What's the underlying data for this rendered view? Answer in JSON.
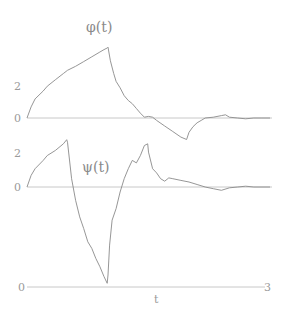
{
  "chart_data": [
    {
      "type": "line",
      "title": "φ(t)",
      "xlabel": "t",
      "ylabel": "",
      "xlim": [
        0,
        3
      ],
      "ylim": [
        -1,
        4.5
      ],
      "yticks": [
        "0",
        "2"
      ],
      "grid": false,
      "series": [
        {
          "name": "phi",
          "x": [
            0,
            0.05,
            0.1,
            0.2,
            0.25,
            0.35,
            0.45,
            0.5,
            0.6,
            0.7,
            0.8,
            0.9,
            0.95,
            0.99,
            1.0,
            1.03,
            1.07,
            1.1,
            1.15,
            1.2,
            1.25,
            1.3,
            1.35,
            1.4,
            1.45,
            1.5,
            1.55,
            1.6,
            1.7,
            1.8,
            1.9,
            1.97,
            2.0,
            2.05,
            2.1,
            2.15,
            2.2,
            2.3,
            2.4,
            2.45,
            2.5,
            2.6,
            2.7,
            2.8,
            2.9,
            3.0
          ],
          "values": [
            0,
            0.7,
            1.2,
            1.7,
            2.0,
            2.4,
            2.8,
            3.0,
            3.25,
            3.55,
            3.85,
            4.15,
            4.3,
            4.4,
            4.45,
            3.6,
            2.8,
            2.3,
            1.9,
            1.4,
            1.1,
            0.9,
            0.6,
            0.3,
            0.05,
            0.1,
            0.05,
            -0.15,
            -0.5,
            -0.85,
            -1.2,
            -1.35,
            -0.9,
            -0.55,
            -0.3,
            -0.15,
            0,
            0.05,
            0.15,
            0.2,
            0.05,
            0,
            -0.05,
            0,
            0,
            0
          ]
        }
      ]
    },
    {
      "type": "line",
      "title": "ψ(t)",
      "xlabel": "t",
      "ylabel": "",
      "xlim": [
        0,
        3
      ],
      "ylim": [
        -5.8,
        3
      ],
      "yticks": [
        "0",
        "2"
      ],
      "grid": false,
      "series": [
        {
          "name": "psi",
          "x": [
            0,
            0.05,
            0.1,
            0.2,
            0.25,
            0.35,
            0.45,
            0.49,
            0.5,
            0.55,
            0.6,
            0.65,
            0.7,
            0.75,
            0.8,
            0.85,
            0.9,
            0.95,
            0.99,
            1.0,
            1.02,
            1.05,
            1.1,
            1.15,
            1.2,
            1.25,
            1.3,
            1.35,
            1.4,
            1.45,
            1.49,
            1.5,
            1.55,
            1.6,
            1.65,
            1.7,
            1.75,
            1.8,
            1.9,
            2.0,
            2.1,
            2.2,
            2.3,
            2.4,
            2.5,
            2.6,
            2.7,
            2.8,
            3.0
          ],
          "values": [
            0,
            0.7,
            1.1,
            1.6,
            1.9,
            2.2,
            2.6,
            2.85,
            2.7,
            0.5,
            -0.8,
            -1.8,
            -2.5,
            -3.3,
            -3.7,
            -4.3,
            -4.8,
            -5.4,
            -5.8,
            -5.3,
            -3.5,
            -2.0,
            -1.3,
            -0.3,
            0.5,
            1.1,
            1.6,
            1.45,
            1.9,
            2.5,
            2.6,
            2.1,
            1.1,
            0.85,
            0.5,
            0.35,
            0.55,
            0.5,
            0.4,
            0.3,
            0.15,
            0.0,
            -0.1,
            -0.2,
            -0.05,
            0.0,
            0.05,
            0.0,
            0.0
          ]
        }
      ]
    }
  ],
  "labels": {
    "phi_title": "φ(t)",
    "psi_title": "ψ(t)",
    "phi_tick_2": "2",
    "phi_tick_0": "0",
    "psi_tick_2": "2",
    "psi_tick_0": "0",
    "x_start": "0",
    "x_end": "3",
    "x_axis": "t"
  }
}
